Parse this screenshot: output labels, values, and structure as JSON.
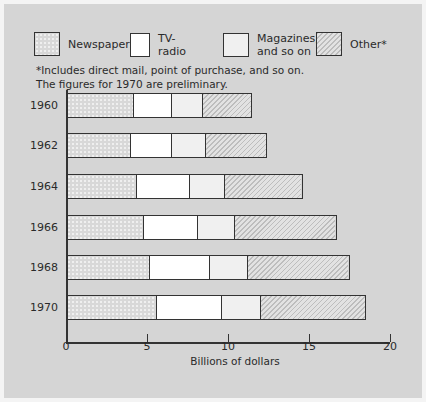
{
  "legend": [
    {
      "label": "Newspapers",
      "fill": "news"
    },
    {
      "label": "TV-radio",
      "fill": "tv"
    },
    {
      "label": "Magazines,\nand so on",
      "fill": "mag"
    },
    {
      "label": "Other*",
      "fill": "other"
    }
  ],
  "notes": {
    "footnote": "*Includes direct mail, point of purchase, and so on.",
    "preliminary": "The figures for 1970 are preliminary."
  },
  "axis": {
    "xlabel": "Billions of dollars",
    "ticks": [
      "0",
      "5",
      "10",
      "15",
      "20"
    ]
  },
  "chart_data": {
    "type": "bar",
    "orientation": "horizontal",
    "stacked": true,
    "title": "",
    "xlabel": "Billions of dollars",
    "ylabel": "",
    "xlim": [
      0,
      20
    ],
    "x_ticks": [
      0,
      5,
      10,
      15,
      20
    ],
    "categories": [
      "1960",
      "1962",
      "1964",
      "1966",
      "1968",
      "1970"
    ],
    "series": [
      {
        "name": "Newspapers",
        "values": [
          4.1,
          3.9,
          4.3,
          4.7,
          5.1,
          5.5
        ]
      },
      {
        "name": "TV-radio",
        "values": [
          2.4,
          2.6,
          3.3,
          3.4,
          3.7,
          4.1
        ]
      },
      {
        "name": "Magazines, and so on",
        "values": [
          1.9,
          2.1,
          2.2,
          2.3,
          2.4,
          2.4
        ]
      },
      {
        "name": "Other*",
        "values": [
          3.1,
          3.8,
          4.8,
          6.3,
          6.3,
          6.5
        ]
      }
    ],
    "totals": [
      11.5,
      12.4,
      14.6,
      16.7,
      17.5,
      18.5
    ],
    "legend_position": "top",
    "grid": false,
    "annotations": [
      "*Includes direct mail, point of purchase, and so on.",
      "The figures for 1970 are preliminary."
    ]
  }
}
